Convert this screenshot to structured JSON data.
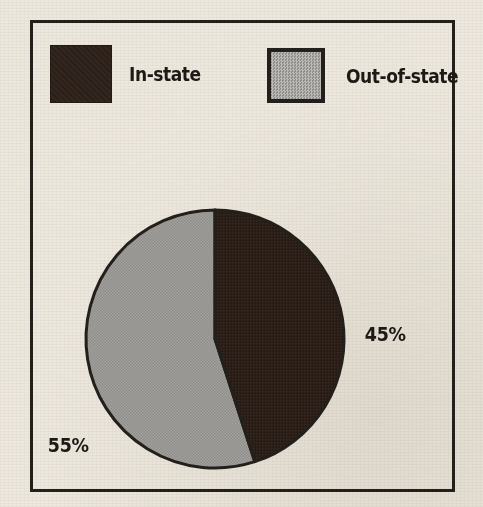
{
  "figure": {
    "background_color": "#EDE8DE",
    "frame_color": "#23201C"
  },
  "legend": {
    "position": "top",
    "entries": [
      {
        "label": "In-state",
        "color": "#2B1F18",
        "swatch_icon": "filled-square-dark"
      },
      {
        "label": "Out-of-state",
        "color": "#9D9C98",
        "swatch_icon": "filled-square-gray"
      }
    ]
  },
  "labels": {
    "in_state_pct": "45%",
    "out_of_state_pct": "55%"
  },
  "chart_data": {
    "type": "pie",
    "title": "",
    "subtitle": "",
    "xlabel": "",
    "ylabel": "",
    "grid": false,
    "legend_position": "top",
    "start_angle_deg": 0,
    "direction": "clockwise",
    "categories": [
      "In-state",
      "Out-of-state"
    ],
    "values": [
      45,
      55
    ],
    "units": "percent",
    "data_labels": [
      "45%",
      "55%"
    ],
    "colors": [
      "#2B1F18",
      "#9D9C98"
    ],
    "slices": [
      {
        "name": "In-state",
        "value": 45,
        "label": "45%",
        "color": "#2B1F18",
        "start_angle_deg": 0,
        "end_angle_deg": 162
      },
      {
        "name": "Out-of-state",
        "value": 55,
        "label": "55%",
        "color": "#9D9C98",
        "start_angle_deg": 162,
        "end_angle_deg": 360
      }
    ]
  }
}
